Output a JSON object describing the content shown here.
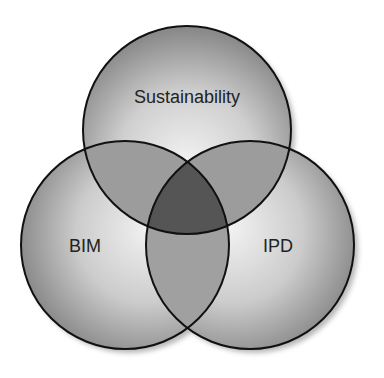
{
  "diagram": {
    "type": "venn",
    "sets": [
      {
        "id": "sustainability",
        "label": "Sustainability"
      },
      {
        "id": "bim",
        "label": "BIM"
      },
      {
        "id": "ipd",
        "label": "IPD"
      }
    ],
    "overlaps": [
      {
        "sets": [
          "sustainability",
          "bim"
        ]
      },
      {
        "sets": [
          "sustainability",
          "ipd"
        ]
      },
      {
        "sets": [
          "bim",
          "ipd"
        ]
      },
      {
        "sets": [
          "sustainability",
          "bim",
          "ipd"
        ]
      }
    ],
    "colors": {
      "circle_highlight": "#f2f2f2",
      "circle_edge": "#8a8a8a",
      "pair_overlap": "#9c9c9c",
      "triple_overlap": "#555555",
      "outline": "#111111",
      "shadow": "#9a9a9a"
    }
  }
}
